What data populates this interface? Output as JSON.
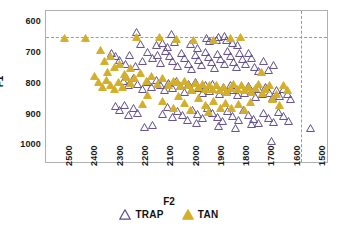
{
  "chart_data": {
    "type": "scatter",
    "title": "",
    "xlabel": "F2",
    "ylabel": "F1",
    "xlim": [
      2560,
      1440
    ],
    "ylim": [
      1060,
      565
    ],
    "x_inverted": true,
    "y_inverted": true,
    "grid": false,
    "legend_position": "bottom-center",
    "xticks": [
      2500,
      2400,
      2300,
      2200,
      2100,
      2000,
      1900,
      1800,
      1700,
      1600,
      1500
    ],
    "yticks": [
      600,
      700,
      800,
      900,
      1000
    ],
    "reference_lines": [
      {
        "name": "horizontal-f1-reference",
        "orientation": "horizontal",
        "value": 650,
        "style": "dashed",
        "color": "#9a9a9a"
      },
      {
        "name": "vertical-f2-reference",
        "orientation": "vertical",
        "value": 1550,
        "style": "dashed",
        "color": "#9a9a9a"
      }
    ],
    "series": [
      {
        "name": "TRAP",
        "marker": "open-triangle",
        "color": "#5b4a8a",
        "fill": "none",
        "points": [
          [
            2200,
            633
          ],
          [
            2063,
            638
          ],
          [
            1925,
            651
          ],
          [
            1879,
            648
          ],
          [
            1855,
            645
          ],
          [
            2188,
            672
          ],
          [
            2123,
            676
          ],
          [
            2097,
            669
          ],
          [
            2080,
            681
          ],
          [
            2053,
            665
          ],
          [
            1990,
            672
          ],
          [
            1960,
            684
          ],
          [
            1912,
            663
          ],
          [
            1885,
            658
          ],
          [
            1845,
            660
          ],
          [
            1820,
            668
          ],
          [
            1802,
            676
          ],
          [
            2300,
            700
          ],
          [
            2283,
            712
          ],
          [
            2268,
            722
          ],
          [
            2245,
            735
          ],
          [
            2228,
            706
          ],
          [
            2205,
            744
          ],
          [
            2178,
            728
          ],
          [
            2160,
            697
          ],
          [
            2140,
            716
          ],
          [
            2120,
            706
          ],
          [
            2105,
            733
          ],
          [
            2088,
            694
          ],
          [
            2070,
            709
          ],
          [
            2058,
            726
          ],
          [
            2040,
            744
          ],
          [
            2025,
            700
          ],
          [
            2010,
            718
          ],
          [
            1998,
            736
          ],
          [
            1985,
            752
          ],
          [
            1970,
            707
          ],
          [
            1958,
            724
          ],
          [
            1944,
            741
          ],
          [
            1930,
            699
          ],
          [
            1918,
            715
          ],
          [
            1905,
            731
          ],
          [
            1893,
            748
          ],
          [
            1880,
            704
          ],
          [
            1868,
            721
          ],
          [
            1855,
            738
          ],
          [
            1842,
            694
          ],
          [
            1830,
            712
          ],
          [
            1818,
            729
          ],
          [
            1806,
            746
          ],
          [
            1795,
            702
          ],
          [
            1783,
            720
          ],
          [
            1770,
            737
          ],
          [
            1758,
            700
          ],
          [
            1745,
            718
          ],
          [
            1733,
            745
          ],
          [
            1720,
            760
          ],
          [
            1700,
            726
          ],
          [
            1680,
            755
          ],
          [
            1660,
            741
          ],
          [
            2255,
            790
          ],
          [
            2235,
            806
          ],
          [
            2215,
            783
          ],
          [
            2196,
            800
          ],
          [
            2178,
            817
          ],
          [
            2160,
            794
          ],
          [
            2142,
            811
          ],
          [
            2124,
            788
          ],
          [
            2106,
            805
          ],
          [
            2090,
            822
          ],
          [
            2074,
            798
          ],
          [
            2058,
            815
          ],
          [
            2042,
            792
          ],
          [
            2026,
            809
          ],
          [
            2012,
            826
          ],
          [
            1998,
            802
          ],
          [
            1984,
            819
          ],
          [
            1970,
            796
          ],
          [
            1956,
            813
          ],
          [
            1942,
            830
          ],
          [
            1928,
            806
          ],
          [
            1914,
            823
          ],
          [
            1900,
            800
          ],
          [
            1886,
            817
          ],
          [
            1872,
            834
          ],
          [
            1858,
            810
          ],
          [
            1844,
            827
          ],
          [
            1830,
            804
          ],
          [
            1816,
            821
          ],
          [
            1802,
            838
          ],
          [
            1788,
            814
          ],
          [
            1774,
            831
          ],
          [
            1760,
            808
          ],
          [
            1746,
            825
          ],
          [
            1732,
            842
          ],
          [
            1718,
            818
          ],
          [
            1704,
            835
          ],
          [
            1690,
            812
          ],
          [
            1676,
            829
          ],
          [
            1662,
            846
          ],
          [
            1648,
            822
          ],
          [
            1634,
            839
          ],
          [
            1620,
            816
          ],
          [
            1606,
            833
          ],
          [
            1592,
            850
          ],
          [
            2285,
            872
          ],
          [
            2268,
            886
          ],
          [
            2250,
            868
          ],
          [
            2232,
            901
          ],
          [
            2214,
            880
          ],
          [
            2196,
            894
          ],
          [
            2100,
            898
          ],
          [
            2080,
            876
          ],
          [
            2060,
            909
          ],
          [
            2040,
            888
          ],
          [
            2020,
            902
          ],
          [
            2000,
            918
          ],
          [
            1980,
            884
          ],
          [
            1960,
            898
          ],
          [
            1940,
            912
          ],
          [
            1920,
            880
          ],
          [
            1900,
            894
          ],
          [
            1880,
            908
          ],
          [
            1860,
            922
          ],
          [
            1840,
            890
          ],
          [
            1820,
            904
          ],
          [
            1800,
            918
          ],
          [
            1780,
            886
          ],
          [
            1760,
            900
          ],
          [
            1740,
            914
          ],
          [
            1720,
            928
          ],
          [
            1700,
            896
          ],
          [
            1680,
            910
          ],
          [
            1660,
            924
          ],
          [
            1640,
            892
          ],
          [
            1620,
            906
          ],
          [
            1600,
            920
          ],
          [
            1668,
            985
          ],
          [
            1512,
            942
          ],
          [
            2140,
            935
          ],
          [
            2170,
            940
          ],
          [
            1966,
            926
          ],
          [
            1878,
            936
          ],
          [
            1812,
            944
          ],
          [
            1746,
            932
          ]
        ]
      },
      {
        "name": "TAN",
        "marker": "filled-triangle",
        "color": "#d4af2a",
        "fill": "#d4af2a",
        "points": [
          [
            2487,
            652
          ],
          [
            2405,
            652
          ],
          [
            2200,
            650
          ],
          [
            2112,
            650
          ],
          [
            2042,
            655
          ],
          [
            1978,
            660
          ],
          [
            1898,
            658
          ],
          [
            1830,
            652
          ],
          [
            1790,
            649
          ],
          [
            2345,
            690
          ],
          [
            2303,
            712
          ],
          [
            2330,
            728
          ],
          [
            2290,
            745
          ],
          [
            2318,
            762
          ],
          [
            2270,
            735
          ],
          [
            2250,
            768
          ],
          [
            2225,
            748
          ],
          [
            2208,
            783
          ],
          [
            2186,
            766
          ],
          [
            2164,
            790
          ],
          [
            2142,
            774
          ],
          [
            2120,
            800
          ],
          [
            2098,
            782
          ],
          [
            2076,
            806
          ],
          [
            2054,
            790
          ],
          [
            2368,
            775
          ],
          [
            2352,
            795
          ],
          [
            2336,
            810
          ],
          [
            2320,
            788
          ],
          [
            2304,
            803
          ],
          [
            2288,
            818
          ],
          [
            2272,
            796
          ],
          [
            2256,
            812
          ],
          [
            2240,
            780
          ],
          [
            2224,
            798
          ],
          [
            2040,
            795
          ],
          [
            2026,
            808
          ],
          [
            2012,
            792
          ],
          [
            1998,
            806
          ],
          [
            1984,
            820
          ],
          [
            1970,
            798
          ],
          [
            1956,
            812
          ],
          [
            1942,
            800
          ],
          [
            1928,
            816
          ],
          [
            1914,
            804
          ],
          [
            1900,
            818
          ],
          [
            1886,
            806
          ],
          [
            1872,
            822
          ],
          [
            1858,
            810
          ],
          [
            1844,
            826
          ],
          [
            1830,
            814
          ],
          [
            1816,
            802
          ],
          [
            1802,
            818
          ],
          [
            1788,
            806
          ],
          [
            1774,
            822
          ],
          [
            1760,
            810
          ],
          [
            1746,
            826
          ],
          [
            1732,
            814
          ],
          [
            1718,
            802
          ],
          [
            1704,
            830
          ],
          [
            1690,
            818
          ],
          [
            1676,
            806
          ],
          [
            1662,
            850
          ],
          [
            1648,
            834
          ],
          [
            1634,
            870
          ],
          [
            1620,
            806
          ],
          [
            1606,
            822
          ],
          [
            2180,
            866
          ],
          [
            2098,
            856
          ],
          [
            2035,
            840
          ],
          [
            2010,
            862
          ],
          [
            1956,
            848
          ],
          [
            1930,
            870
          ],
          [
            1896,
            856
          ],
          [
            1870,
            878
          ],
          [
            1850,
            862
          ],
          [
            1826,
            880
          ],
          [
            1800,
            866
          ],
          [
            1775,
            884
          ],
          [
            1752,
            858
          ],
          [
            2158,
            838
          ],
          [
            2055,
            878
          ],
          [
            1988,
            886
          ],
          [
            1918,
            892
          ],
          [
            1708,
            762
          ]
        ]
      }
    ]
  },
  "legend": {
    "items": [
      {
        "label": "TRAP",
        "glyph": "open-triangle-icon",
        "color": "#5b4a8a"
      },
      {
        "label": "TAN",
        "glyph": "filled-triangle-icon",
        "color": "#d4af2a"
      }
    ]
  },
  "axes": {
    "x_label": "F2",
    "y_label": "F1",
    "x_ticks": [
      "2500",
      "2400",
      "2300",
      "2200",
      "2100",
      "2000",
      "1900",
      "1800",
      "1700",
      "1600",
      "1500"
    ],
    "y_ticks": [
      "600",
      "700",
      "800",
      "900",
      "1000"
    ]
  },
  "colors": {
    "trap": "#5b4a8a",
    "tan": "#d4af2a",
    "frame": "#b0b0b0",
    "refline": "#9a9a9a",
    "background": "#ffffff",
    "text": "#111111"
  }
}
